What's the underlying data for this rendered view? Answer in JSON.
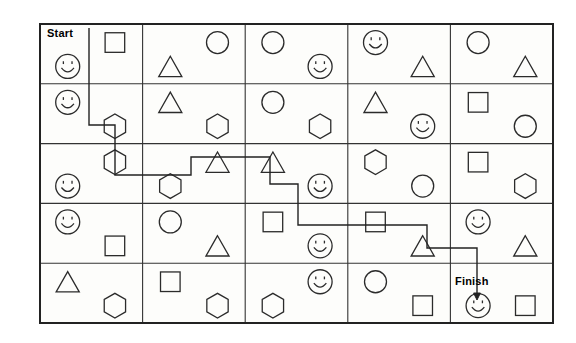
{
  "puzzle": {
    "title": "Shape Maze Worksheet",
    "start_label": "Start",
    "finish_label": "Finish",
    "grid": {
      "rows": 5,
      "cols": 5,
      "x": 40,
      "y": 24,
      "width": 513,
      "height": 299,
      "border_color": "#222222",
      "line_color": "#333333",
      "path_color": "#222222",
      "background": "#fdfdfb"
    },
    "legend": {
      "shape_names": [
        "circle",
        "square",
        "triangle",
        "hexagon",
        "smiley"
      ]
    },
    "cells": [
      [
        {
          "shapes": [
            {
              "type": "smiley",
              "pos": "bottom-left"
            },
            {
              "type": "square",
              "pos": "top-right"
            }
          ]
        },
        {
          "shapes": [
            {
              "type": "triangle",
              "pos": "bottom-left"
            },
            {
              "type": "circle",
              "pos": "top-right"
            }
          ]
        },
        {
          "shapes": [
            {
              "type": "circle",
              "pos": "top-left"
            },
            {
              "type": "smiley",
              "pos": "bottom-right"
            }
          ]
        },
        {
          "shapes": [
            {
              "type": "smiley",
              "pos": "top-left"
            },
            {
              "type": "triangle",
              "pos": "bottom-right"
            }
          ]
        },
        {
          "shapes": [
            {
              "type": "circle",
              "pos": "top-left"
            },
            {
              "type": "triangle",
              "pos": "bottom-right"
            }
          ]
        }
      ],
      [
        {
          "shapes": [
            {
              "type": "smiley",
              "pos": "top-left"
            },
            {
              "type": "hexagon",
              "pos": "bottom-right"
            }
          ]
        },
        {
          "shapes": [
            {
              "type": "triangle",
              "pos": "top-left"
            },
            {
              "type": "hexagon",
              "pos": "bottom-right"
            }
          ]
        },
        {
          "shapes": [
            {
              "type": "circle",
              "pos": "top-left"
            },
            {
              "type": "hexagon",
              "pos": "bottom-right"
            }
          ]
        },
        {
          "shapes": [
            {
              "type": "triangle",
              "pos": "top-left"
            },
            {
              "type": "smiley",
              "pos": "bottom-right"
            }
          ]
        },
        {
          "shapes": [
            {
              "type": "square",
              "pos": "top-left"
            },
            {
              "type": "circle",
              "pos": "bottom-right"
            }
          ]
        }
      ],
      [
        {
          "shapes": [
            {
              "type": "hexagon",
              "pos": "top-right"
            },
            {
              "type": "smiley",
              "pos": "bottom-left"
            }
          ]
        },
        {
          "shapes": [
            {
              "type": "triangle",
              "pos": "top-right"
            },
            {
              "type": "hexagon",
              "pos": "bottom-left"
            }
          ]
        },
        {
          "shapes": [
            {
              "type": "triangle",
              "pos": "top-left"
            },
            {
              "type": "smiley",
              "pos": "bottom-right"
            }
          ]
        },
        {
          "shapes": [
            {
              "type": "hexagon",
              "pos": "top-left"
            },
            {
              "type": "circle",
              "pos": "bottom-right"
            }
          ]
        },
        {
          "shapes": [
            {
              "type": "square",
              "pos": "top-left"
            },
            {
              "type": "hexagon",
              "pos": "bottom-right"
            }
          ]
        }
      ],
      [
        {
          "shapes": [
            {
              "type": "smiley",
              "pos": "top-left"
            },
            {
              "type": "square",
              "pos": "bottom-right"
            }
          ]
        },
        {
          "shapes": [
            {
              "type": "circle",
              "pos": "top-left"
            },
            {
              "type": "triangle",
              "pos": "bottom-right"
            }
          ]
        },
        {
          "shapes": [
            {
              "type": "square",
              "pos": "top-left"
            },
            {
              "type": "smiley",
              "pos": "bottom-right"
            }
          ]
        },
        {
          "shapes": [
            {
              "type": "square",
              "pos": "top-left"
            },
            {
              "type": "triangle",
              "pos": "bottom-right"
            }
          ]
        },
        {
          "shapes": [
            {
              "type": "smiley",
              "pos": "top-left"
            },
            {
              "type": "triangle",
              "pos": "bottom-right"
            }
          ]
        }
      ],
      [
        {
          "shapes": [
            {
              "type": "triangle",
              "pos": "top-left"
            },
            {
              "type": "hexagon",
              "pos": "bottom-right"
            }
          ]
        },
        {
          "shapes": [
            {
              "type": "square",
              "pos": "top-left"
            },
            {
              "type": "hexagon",
              "pos": "bottom-right"
            }
          ]
        },
        {
          "shapes": [
            {
              "type": "hexagon",
              "pos": "bottom-left"
            },
            {
              "type": "smiley",
              "pos": "top-right"
            }
          ]
        },
        {
          "shapes": [
            {
              "type": "circle",
              "pos": "top-left"
            },
            {
              "type": "square",
              "pos": "bottom-right"
            }
          ]
        },
        {
          "shapes": [
            {
              "type": "smiley",
              "pos": "bottom-left"
            },
            {
              "type": "square",
              "pos": "bottom-right"
            }
          ]
        }
      ]
    ],
    "path": {
      "description": "Solution route drawn from Start marker down and across the grid to the Finish smiley",
      "points": [
        [
          89,
          28
        ],
        [
          89,
          125
        ],
        [
          115,
          125
        ],
        [
          115,
          175
        ],
        [
          191,
          175
        ],
        [
          191,
          157
        ],
        [
          270,
          157
        ],
        [
          270,
          184
        ],
        [
          298,
          184
        ],
        [
          298,
          225
        ],
        [
          427,
          225
        ],
        [
          427,
          248
        ],
        [
          477,
          248
        ],
        [
          477,
          296
        ]
      ],
      "arrow_at_end": true,
      "start_marker_x": 89,
      "start_marker_y": 28
    },
    "labels": {
      "start": {
        "text": "Start",
        "x": 47,
        "y": 27
      },
      "finish": {
        "text": "Finish",
        "x": 455,
        "y": 275
      }
    }
  }
}
